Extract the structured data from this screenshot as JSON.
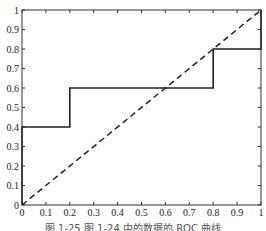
{
  "chart_data": {
    "type": "line",
    "title": "",
    "xlabel": "",
    "ylabel": "",
    "xlim": [
      0,
      1
    ],
    "ylim": [
      0,
      1
    ],
    "grid": false,
    "x_ticks": [
      "0",
      "0.1",
      "0.2",
      "0.3",
      "0.4",
      "0.5",
      "0.6",
      "0.7",
      "0.8",
      "0.9",
      "1"
    ],
    "y_ticks": [
      "0",
      "0.1",
      "0.2",
      "0.3",
      "0.4",
      "0.5",
      "0.6",
      "0.7",
      "0.8",
      "0.9",
      "1"
    ],
    "series": [
      {
        "name": "ROC",
        "style": "solid",
        "x": [
          0,
          0,
          0.2,
          0.2,
          0.8,
          0.8,
          1,
          1
        ],
        "y": [
          0,
          0.4,
          0.4,
          0.6,
          0.6,
          0.8,
          0.8,
          1
        ]
      },
      {
        "name": "diagonal",
        "style": "dashed",
        "x": [
          0,
          1
        ],
        "y": [
          0,
          1
        ]
      }
    ]
  },
  "caption": "图 1-25  图 1-24 中的数据的 ROC 曲线"
}
